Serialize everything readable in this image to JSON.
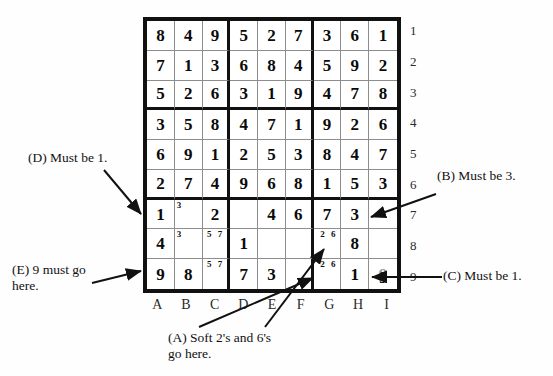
{
  "puzzle": {
    "title": "Sudoku grid with pencil marks and annotations",
    "column_labels": [
      "A",
      "B",
      "C",
      "D",
      "E",
      "F",
      "G",
      "H",
      "I"
    ],
    "row_labels": [
      "1",
      "2",
      "3",
      "4",
      "5",
      "6",
      "7",
      "8",
      "9"
    ],
    "cells": [
      [
        {
          "v": "8"
        },
        {
          "v": "4"
        },
        {
          "v": "9"
        },
        {
          "v": "5"
        },
        {
          "v": "2"
        },
        {
          "v": "7"
        },
        {
          "v": "3"
        },
        {
          "v": "6"
        },
        {
          "v": "1"
        }
      ],
      [
        {
          "v": "7"
        },
        {
          "v": "1"
        },
        {
          "v": "3"
        },
        {
          "v": "6"
        },
        {
          "v": "8"
        },
        {
          "v": "4"
        },
        {
          "v": "5"
        },
        {
          "v": "9"
        },
        {
          "v": "2"
        }
      ],
      [
        {
          "v": "5"
        },
        {
          "v": "2"
        },
        {
          "v": "6"
        },
        {
          "v": "3"
        },
        {
          "v": "1"
        },
        {
          "v": "9"
        },
        {
          "v": "4"
        },
        {
          "v": "7"
        },
        {
          "v": "8"
        }
      ],
      [
        {
          "v": "3"
        },
        {
          "v": "5"
        },
        {
          "v": "8"
        },
        {
          "v": "4"
        },
        {
          "v": "7"
        },
        {
          "v": "1"
        },
        {
          "v": "9"
        },
        {
          "v": "2"
        },
        {
          "v": "6"
        }
      ],
      [
        {
          "v": "6"
        },
        {
          "v": "9"
        },
        {
          "v": "1"
        },
        {
          "v": "2"
        },
        {
          "v": "5"
        },
        {
          "v": "3"
        },
        {
          "v": "8"
        },
        {
          "v": "4"
        },
        {
          "v": "7"
        }
      ],
      [
        {
          "v": "2"
        },
        {
          "v": "7"
        },
        {
          "v": "4"
        },
        {
          "v": "9"
        },
        {
          "v": "6"
        },
        {
          "v": "8"
        },
        {
          "v": "1"
        },
        {
          "v": "5"
        },
        {
          "v": "3"
        }
      ],
      [
        {
          "v": "1"
        },
        {
          "v": "",
          "p": "3"
        },
        {
          "v": "2"
        },
        {
          "v": ""
        },
        {
          "v": "4"
        },
        {
          "v": "6"
        },
        {
          "v": "7"
        },
        {
          "v": "3"
        },
        {
          "v": ""
        }
      ],
      [
        {
          "v": "4"
        },
        {
          "v": "",
          "p": "3"
        },
        {
          "v": "",
          "p": "5 7"
        },
        {
          "v": "1"
        },
        {
          "v": ""
        },
        {
          "v": ""
        },
        {
          "v": "",
          "p": "2 6"
        },
        {
          "v": "8"
        },
        {
          "v": ""
        }
      ],
      [
        {
          "v": "9"
        },
        {
          "v": "8"
        },
        {
          "v": "",
          "p": "5 7"
        },
        {
          "v": "7"
        },
        {
          "v": "3"
        },
        {
          "v": ""
        },
        {
          "v": "",
          "p": "2 6"
        },
        {
          "v": "1"
        },
        {
          "v": "9",
          "faint": true
        }
      ]
    ],
    "arrow_digit": "9"
  },
  "annotations": {
    "a": "(A) Soft 2's and 6's\ngo here.",
    "b": "(B) Must be 3.",
    "c": "(C) Must be 1.",
    "d": "(D) Must be 1.",
    "e": "(E) 9 must go\nhere."
  },
  "colors": {
    "grid_border": "#111111",
    "cell_line": "#8d8d8d",
    "digit": "#0a0a0a",
    "faint_digit": "#9a9a9a",
    "background": "#fefefe"
  }
}
